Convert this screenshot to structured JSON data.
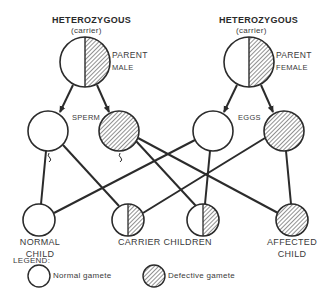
{
  "colors": {
    "stroke": "#2b2b2b",
    "hatch": "#555555",
    "fill_normal": "#ffffff",
    "text": "#3a3a3a"
  },
  "parents": {
    "male": {
      "title": "HETEROZYGOUS",
      "subtitle": "(carrier)",
      "role": "PARENT",
      "sex": "MALE",
      "genotype": "half-normal-half-defective"
    },
    "female": {
      "title": "HETEROZYGOUS",
      "subtitle": "(carrier)",
      "role": "PARENT",
      "sex": "FEMALE",
      "genotype": "half-normal-half-defective"
    }
  },
  "gametes": {
    "sperm_label": "SPERM",
    "eggs_label": "EGGS",
    "items": [
      {
        "id": "sperm-normal",
        "type": "normal"
      },
      {
        "id": "sperm-defective",
        "type": "defective"
      },
      {
        "id": "egg-normal",
        "type": "normal"
      },
      {
        "id": "egg-defective",
        "type": "defective"
      }
    ]
  },
  "children": {
    "normal": {
      "line1": "NORMAL",
      "line2": "CHILD"
    },
    "carrier": {
      "line1": "CARRIER CHILDREN"
    },
    "affected": {
      "line1": "AFFECTED",
      "line2": "CHILD"
    }
  },
  "connections": [
    {
      "from": "sperm-normal",
      "to": "normal-child"
    },
    {
      "from": "sperm-normal",
      "to": "carrier-child-1"
    },
    {
      "from": "sperm-defective",
      "to": "carrier-child-2"
    },
    {
      "from": "sperm-defective",
      "to": "affected-child"
    },
    {
      "from": "egg-normal",
      "to": "normal-child"
    },
    {
      "from": "egg-normal",
      "to": "carrier-child-2"
    },
    {
      "from": "egg-defective",
      "to": "carrier-child-1"
    },
    {
      "from": "egg-defective",
      "to": "affected-child"
    }
  ],
  "legend": {
    "title": "LEGEND:",
    "normal_label": "Normal gamete",
    "defective_label": "Defective gamete"
  }
}
